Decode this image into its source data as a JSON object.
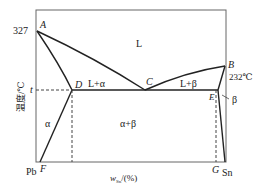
{
  "diagram": {
    "y_axis": {
      "label": "温度/℃",
      "ticks": [
        "327",
        "t"
      ]
    },
    "x_axis": {
      "label_main": "w",
      "label_sub": "Sn",
      "label_suffix": "/(%)",
      "left_end": "Pb",
      "right_end": "Sn"
    },
    "points": {
      "A": "A",
      "B": "B",
      "C": "C",
      "D": "D",
      "E": "E",
      "F": "F",
      "G": "G"
    },
    "regions": {
      "liquid": "L",
      "l_alpha": "L+α",
      "l_beta": "L+β",
      "alpha": "α",
      "beta": "β",
      "alpha_beta": "α+β"
    },
    "annotations": {
      "sn_melting": "232℃",
      "pb_melting": "327"
    }
  }
}
